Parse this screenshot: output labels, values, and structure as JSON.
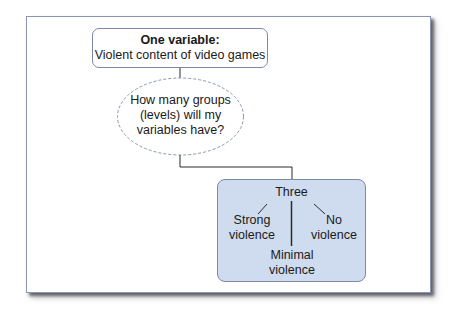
{
  "diagram": {
    "top_box": {
      "title": "One variable:",
      "subtitle": "Violent content of video games"
    },
    "question": {
      "line1": "How many groups",
      "line2": "(levels) will my",
      "line3": "variables have?"
    },
    "answer_box": {
      "root": "Three",
      "levels": [
        {
          "line1": "Strong",
          "line2": "violence"
        },
        {
          "line1": "Minimal",
          "line2": "violence"
        },
        {
          "line1": "No",
          "line2": "violence"
        }
      ]
    }
  },
  "colors": {
    "box_border": "#7d89a9",
    "answer_fill": "#cfdbef",
    "dashed_border": "#8a94b4",
    "connector": "#2a2a2a"
  }
}
